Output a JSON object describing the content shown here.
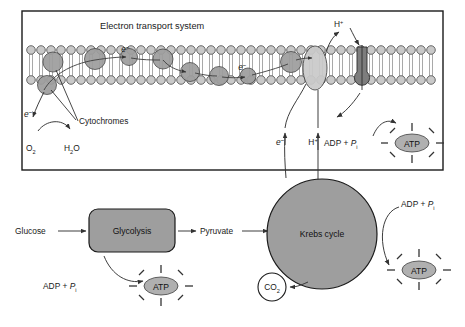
{
  "figure": {
    "type": "biology-diagram"
  },
  "ets_panel": {
    "title": "Electron transport system",
    "border_color": "#1a1a1a",
    "membrane": {
      "head_fill": "#c9c9c9",
      "head_stroke": "#4a4a4a",
      "tail_color": "#9a9a9a",
      "upper_heads": 40,
      "lower_heads": 40
    },
    "proteins": {
      "cytochrome_fill": "#a0a0a0",
      "carrier_fill": "#cacaca",
      "synthase_fill": "#7d7d7d"
    },
    "labels": {
      "cytochromes": "Cytochromes",
      "electron_left": "e",
      "electron_sup": "–",
      "oxygen": "O",
      "oxygen_sub": "2",
      "water": "H",
      "water_sub": "2",
      "water_tail": "O",
      "proton_top": "H",
      "proton_top_sup": "+",
      "electron_bottom": "e",
      "electron_bottom_sup": "–",
      "proton_bottom": "H",
      "proton_bottom_sup": "+",
      "adp": "ADP + ",
      "adp_p": "P",
      "adp_p_sub": "i",
      "atp": "ATP",
      "e_in_chain_1": "e",
      "e_in_chain_2": "e"
    }
  },
  "pathway": {
    "glucose": "Glucose",
    "glycolysis": "Glycolysis",
    "pyruvate": "Pyruvate",
    "krebs": "Krebs cycle",
    "co2": "CO",
    "co2_sub": "2",
    "adp_left": "ADP + ",
    "adp_left_p": "P",
    "adp_left_p_sub": "i",
    "atp_left": "ATP",
    "adp_right": "ADP + ",
    "adp_right_p": "P",
    "adp_right_p_sub": "i",
    "atp_right": "ATP"
  },
  "colors": {
    "box_fill": "#9e9e9e",
    "krebs_fill": "#9e9e9e",
    "atp_fill": "#b0b0b0",
    "line": "#333333",
    "outline": "#1a1a1a",
    "page_bg": "#ffffff"
  }
}
